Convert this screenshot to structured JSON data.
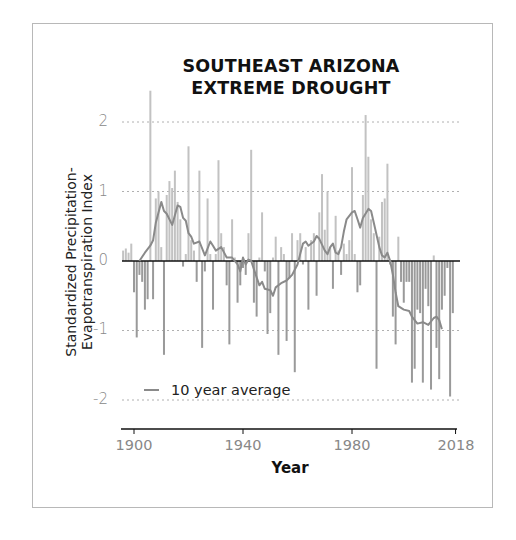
{
  "chart_data": {
    "type": "bar",
    "title": "SOUTHEAST ARIZONA EXTREME DROUGHT",
    "title_lines": [
      "SOUTHEAST ARIZONA",
      "EXTREME DROUGHT"
    ],
    "xlabel": "Year",
    "ylabel": "Standardized Precipitation-Evapotranspiration Index",
    "ylabel_lines": [
      "Standardized Precipitation-",
      "Evapotranspiration Index"
    ],
    "x_ticks": [
      1900,
      1940,
      1980,
      2018
    ],
    "x_tick_labels": [
      "1900",
      "1940",
      "1980",
      "2018"
    ],
    "y_ticks": [
      2,
      1,
      0,
      -1,
      -2
    ],
    "y_tick_labels": [
      "2",
      "1",
      "0",
      "-1",
      "-2"
    ],
    "ylim": [
      -2.4,
      2.6
    ],
    "xlim": [
      1895,
      2019
    ],
    "grid": "horizontal dotted at y ticks",
    "legend": {
      "position": "lower-left",
      "entries": [
        "10 year average"
      ]
    },
    "series": [
      {
        "name": "Annual SPEI",
        "type": "bar",
        "years_start": 1896,
        "values": [
          0.15,
          0.18,
          0.12,
          0.25,
          -0.45,
          -1.1,
          -0.2,
          -0.3,
          -0.7,
          -0.55,
          2.45,
          -0.55,
          0.9,
          1.0,
          0.2,
          -1.35,
          0.95,
          1.15,
          1.05,
          1.3,
          0.85,
          0.6,
          -0.08,
          0.1,
          1.65,
          0.3,
          0.15,
          -0.3,
          1.3,
          -1.25,
          -0.15,
          0.9,
          0.1,
          -0.7,
          0.1,
          1.45,
          0.4,
          0.2,
          -0.35,
          -1.2,
          0.6,
          0.05,
          -0.6,
          -0.35,
          -0.1,
          -0.2,
          0.4,
          1.6,
          -0.6,
          -0.8,
          0.05,
          0.7,
          -0.15,
          -1.05,
          -0.75,
          0.05,
          0.35,
          -1.35,
          0.2,
          0.1,
          -1.15,
          -0.25,
          0.4,
          -1.6,
          0.3,
          0.4,
          -0.05,
          0.2,
          -0.7,
          0.3,
          0.4,
          -0.5,
          0.7,
          1.25,
          0.45,
          1.0,
          0.2,
          -0.4,
          0.65,
          0.15,
          -0.2,
          0.25,
          0.1,
          0.3,
          1.35,
          0.1,
          -0.45,
          -0.35,
          0.95,
          2.1,
          1.5,
          0.6,
          0.4,
          -1.55,
          0.35,
          0.85,
          0.9,
          1.4,
          -0.05,
          -0.8,
          -1.2,
          0.35,
          -0.3,
          -0.6,
          -0.3,
          -0.3,
          -1.75,
          -1.55,
          -0.7,
          -0.75,
          -1.75,
          -0.4,
          -0.65,
          -1.85,
          0.08,
          -1.25,
          -1.7,
          -0.7,
          -0.5,
          -0.1,
          -1.95,
          -0.75
        ],
        "color": "#a9a9a9"
      },
      {
        "name": "10 year average",
        "type": "line",
        "points": [
          [
            1902,
            0.0
          ],
          [
            1904,
            0.12
          ],
          [
            1906,
            0.22
          ],
          [
            1907,
            0.3
          ],
          [
            1908,
            0.55
          ],
          [
            1910,
            0.85
          ],
          [
            1911,
            0.72
          ],
          [
            1912,
            0.68
          ],
          [
            1914,
            0.52
          ],
          [
            1916,
            0.8
          ],
          [
            1917,
            0.78
          ],
          [
            1918,
            0.62
          ],
          [
            1919,
            0.58
          ],
          [
            1920,
            0.4
          ],
          [
            1921,
            0.35
          ],
          [
            1922,
            0.25
          ],
          [
            1924,
            0.28
          ],
          [
            1926,
            0.08
          ],
          [
            1928,
            0.28
          ],
          [
            1929,
            0.22
          ],
          [
            1930,
            0.15
          ],
          [
            1932,
            0.2
          ],
          [
            1934,
            0.05
          ],
          [
            1936,
            0.05
          ],
          [
            1937,
            0.0
          ],
          [
            1938,
            -0.05
          ],
          [
            1939,
            -0.15
          ],
          [
            1940,
            0.05
          ],
          [
            1941,
            -0.05
          ],
          [
            1942,
            0.02
          ],
          [
            1943,
            0.0
          ],
          [
            1944,
            -0.12
          ],
          [
            1946,
            -0.35
          ],
          [
            1947,
            -0.3
          ],
          [
            1948,
            -0.4
          ],
          [
            1950,
            -0.42
          ],
          [
            1951,
            -0.5
          ],
          [
            1952,
            -0.38
          ],
          [
            1954,
            -0.32
          ],
          [
            1956,
            -0.28
          ],
          [
            1958,
            -0.2
          ],
          [
            1960,
            -0.05
          ],
          [
            1961,
            0.1
          ],
          [
            1962,
            0.25
          ],
          [
            1963,
            0.28
          ],
          [
            1964,
            0.22
          ],
          [
            1966,
            0.28
          ],
          [
            1967,
            0.36
          ],
          [
            1968,
            0.32
          ],
          [
            1970,
            0.15
          ],
          [
            1971,
            0.1
          ],
          [
            1972,
            0.2
          ],
          [
            1973,
            0.25
          ],
          [
            1974,
            0.12
          ],
          [
            1975,
            0.1
          ],
          [
            1976,
            0.2
          ],
          [
            1977,
            0.42
          ],
          [
            1978,
            0.6
          ],
          [
            1980,
            0.7
          ],
          [
            1981,
            0.72
          ],
          [
            1982,
            0.6
          ],
          [
            1983,
            0.48
          ],
          [
            1984,
            0.62
          ],
          [
            1986,
            0.75
          ],
          [
            1987,
            0.72
          ],
          [
            1988,
            0.55
          ],
          [
            1990,
            0.2
          ],
          [
            1991,
            0.08
          ],
          [
            1992,
            0.05
          ],
          [
            1993,
            0.12
          ],
          [
            1994,
            0.0
          ],
          [
            1995,
            -0.2
          ],
          [
            1996,
            -0.45
          ],
          [
            1997,
            -0.65
          ],
          [
            1999,
            -0.7
          ],
          [
            2001,
            -0.72
          ],
          [
            2002,
            -0.8
          ],
          [
            2004,
            -0.9
          ],
          [
            2006,
            -0.88
          ],
          [
            2008,
            -0.92
          ],
          [
            2010,
            -0.82
          ],
          [
            2011,
            -0.8
          ],
          [
            2012,
            -0.85
          ],
          [
            2013,
            -0.98
          ]
        ],
        "color": "#8a8a8a"
      }
    ]
  },
  "colors": {
    "bar_positive": "#c2c2c2",
    "bar_negative": "#9a9a9a",
    "line": "#8a8a8a",
    "axis": "#111111",
    "grid": "#b0b0b0",
    "frame": "#b8b8b8"
  }
}
